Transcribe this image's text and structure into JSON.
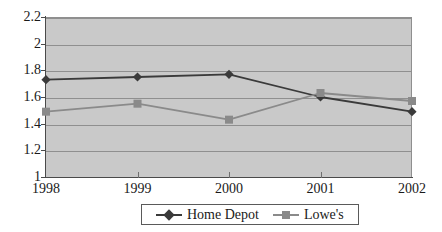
{
  "chart_data": {
    "type": "line",
    "title": "",
    "subtitle": "",
    "xlabel": "",
    "ylabel": "",
    "categories": [
      "1998",
      "1999",
      "2000",
      "2001",
      "2002"
    ],
    "x_tick_labels": [
      "1998",
      "1999",
      "2000",
      "2001",
      "2002"
    ],
    "y_tick_labels": [
      "1",
      "1.2",
      "1.4",
      "1.6",
      "1.8",
      "2",
      "2.2"
    ],
    "y_tick_values": [
      1,
      1.2,
      1.4,
      1.6,
      1.8,
      2,
      2.2
    ],
    "ylim": [
      1,
      2.2
    ],
    "xlim": [
      "1998",
      "2002"
    ],
    "grid": true,
    "grid_axis": "y",
    "legend_position": "bottom-center",
    "plot_background": "#c9c9c9",
    "figure_background": "#ffffff",
    "gridline_color": "#8f8f8f",
    "axis_color": "#4a4a4a",
    "series": [
      {
        "name": "Home Depot",
        "color": "#3a3a3a",
        "marker": "diamond",
        "marker_color": "#3a3a3a",
        "values": [
          1.73,
          1.75,
          1.77,
          1.6,
          1.49
        ]
      },
      {
        "name": "Lowe's",
        "color": "#8a8a8a",
        "marker": "square",
        "marker_color": "#8a8a8a",
        "values": [
          1.49,
          1.55,
          1.43,
          1.63,
          1.57
        ]
      }
    ]
  },
  "legend": {
    "entries": [
      {
        "label": "Home Depot"
      },
      {
        "label": "Lowe's"
      }
    ]
  }
}
